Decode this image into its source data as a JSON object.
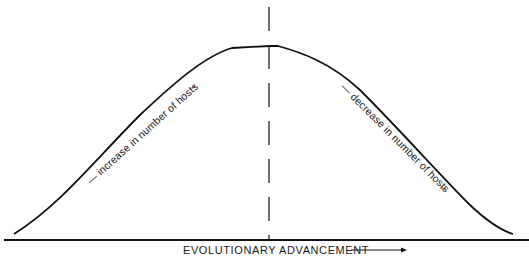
{
  "diagram": {
    "type": "bell-curve concept diagram",
    "xaxis_label": "EVOLUTIONARY  ADVANCEMENT",
    "left_slope_label": "— increase in number of hosts",
    "right_slope_label": "— decrease in number of hosts",
    "arrow_glyph": "→",
    "colors": {
      "line": "#111111",
      "background": "#ffffff"
    },
    "elements": {
      "curve": "symmetric hump rising from left, flat peak at center, falling to right",
      "center_divider": "vertical dashed line at the peak",
      "baseline": "horizontal axis line"
    }
  }
}
